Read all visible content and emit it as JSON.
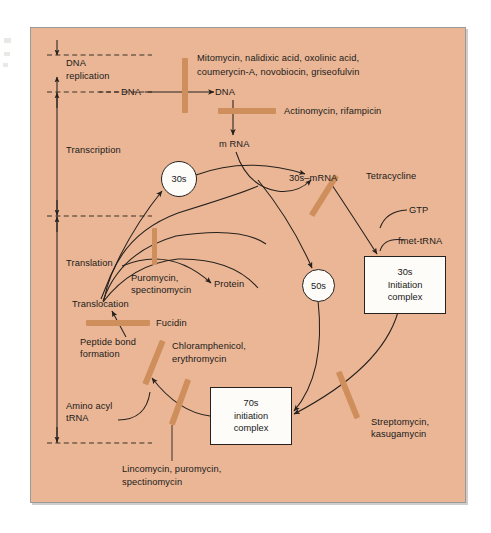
{
  "figure": {
    "type": "biochemical-pathway-diagram",
    "background_color": "#eab695",
    "inhibitor_bar_color": "#cf8f5c",
    "node_fill_color": "#fdfcf8",
    "line_color": "#26211d"
  },
  "stages": [
    {
      "id": "dna-replication",
      "label_line1": "DNA",
      "label_line2": "replication"
    },
    {
      "id": "transcription",
      "label_line1": "Transcription",
      "label_line2": ""
    },
    {
      "id": "translation",
      "label_line1": "Translation",
      "label_line2": ""
    }
  ],
  "molecules": {
    "dna_template": "DNA",
    "dna_product": "DNA",
    "mrna": "m RNA",
    "ribosome_30s": "30s",
    "ribosome_50s": "50s",
    "complex_30s_mrna": "30s–mRNA",
    "gtp": "GTP",
    "fmet_trna": "fmet-tRNA",
    "protein": "Protein",
    "translocation": "Translocation",
    "peptide_bond_line1": "Peptide bond",
    "peptide_bond_line2": "formation",
    "amino_acyl_line1": "Amino acyl",
    "amino_acyl_line2": "tRNA"
  },
  "complexes": [
    {
      "id": "initiation-30s",
      "line1": "30s",
      "line2": "Initiation",
      "line3": "complex"
    },
    {
      "id": "initiation-70s",
      "line1": "70s",
      "line2": "initiation",
      "line3": "complex"
    }
  ],
  "inhibitors": [
    {
      "id": "dna-replication-inhibitors",
      "target": "DNA replication",
      "line1": "Mitomycin, nalidixic acid, oxolinic acid,",
      "line2": "coumerycin-A, novobiocin, griseofulvin",
      "bar": "vertical"
    },
    {
      "id": "transcription-inhibitors",
      "target": "Transcription (DNA to mRNA)",
      "line1": "Actinomycin, rifampicin",
      "line2": "",
      "bar": "horizontal"
    },
    {
      "id": "tetracycline",
      "target": "30s-mRNA to 30s initiation complex",
      "line1": "Tetracycline",
      "line2": "",
      "bar": "diagonal"
    },
    {
      "id": "streptomycin-kasugamycin",
      "target": "50s joining / 70s initiation complex",
      "line1": "Streptomycin,",
      "line2": "kasugamycin",
      "bar": "diagonal"
    },
    {
      "id": "fucidin",
      "target": "Translocation",
      "line1": "Fucidin",
      "line2": "",
      "bar": "horizontal"
    },
    {
      "id": "puromycin-spectinomycin",
      "target": "Protein release / ribosome recycling",
      "line1": "Puromycin,",
      "line2": "spectinomycin",
      "bar": "vertical"
    },
    {
      "id": "chloramphenicol-erythromycin",
      "target": "Peptide bond formation",
      "line1": "Chloramphenicol,",
      "line2": "erythromycin",
      "bar": "diagonal"
    },
    {
      "id": "lincomycin-puromycin-spectinomycin",
      "target": "Aminoacyl tRNA binding / elongation",
      "line1": "Lincomycin, puromycin,",
      "line2": "spectinomycin",
      "bar": "diagonal"
    }
  ]
}
